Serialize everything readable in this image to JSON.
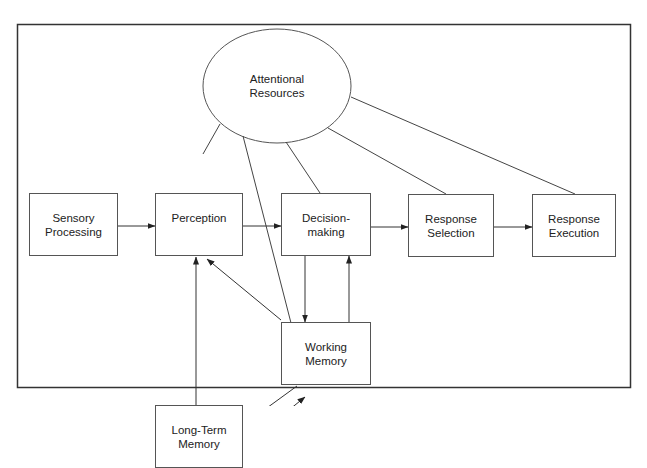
{
  "diagram": {
    "type": "flowchart",
    "nodes": {
      "attentional_resources": {
        "line1": "Attentional",
        "line2": "Resources",
        "shape": "ellipse"
      },
      "sensory_processing": {
        "line1": "Sensory",
        "line2": "Processing"
      },
      "perception": {
        "line1": "Perception"
      },
      "decision_making": {
        "line1": "Decision-",
        "line2": "making"
      },
      "response_selection": {
        "line1": "Response",
        "line2": "Selection"
      },
      "response_execution": {
        "line1": "Response",
        "line2": "Execution"
      },
      "working_memory": {
        "line1": "Working",
        "line2": "Memory"
      },
      "long_term_memory": {
        "line1": "Long-Term",
        "line2": "Memory"
      }
    },
    "edges": [
      {
        "from": "Sensory Processing",
        "to": "Perception",
        "arrow": true
      },
      {
        "from": "Perception",
        "to": "Decision-making",
        "arrow": true
      },
      {
        "from": "Decision-making",
        "to": "Response Selection",
        "arrow": true
      },
      {
        "from": "Response Selection",
        "to": "Response Execution",
        "arrow": true
      },
      {
        "from": "Decision-making",
        "to": "Working Memory",
        "arrow": true
      },
      {
        "from": "Working Memory",
        "to": "Decision-making",
        "arrow": true
      },
      {
        "from": "Working Memory",
        "to": "Perception",
        "arrow": true
      },
      {
        "from": "Long-Term Memory",
        "to": "Perception",
        "arrow": true
      },
      {
        "from": "Working Memory",
        "to": "Long-Term Memory",
        "arrow": true
      },
      {
        "from": "Long-Term Memory",
        "to": "Working Memory",
        "arrow": true
      },
      {
        "from": "Attentional Resources",
        "to": "Perception",
        "arrow": false
      },
      {
        "from": "Attentional Resources",
        "to": "Working Memory",
        "arrow": false
      },
      {
        "from": "Attentional Resources",
        "to": "Decision-making",
        "arrow": false
      },
      {
        "from": "Attentional Resources",
        "to": "Response Selection",
        "arrow": false
      },
      {
        "from": "Attentional Resources",
        "to": "Response Execution",
        "arrow": false
      }
    ]
  }
}
